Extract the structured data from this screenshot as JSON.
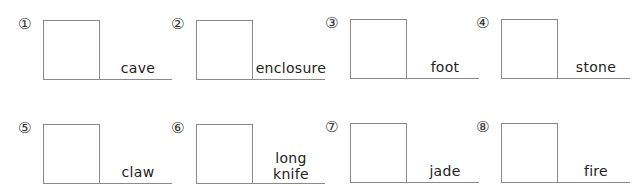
{
  "worksheet": {
    "items": [
      {
        "number": "①",
        "word": "cave"
      },
      {
        "number": "②",
        "word": "enclosure"
      },
      {
        "number": "③",
        "word": "foot"
      },
      {
        "number": "④",
        "word": "stone"
      },
      {
        "number": "⑤",
        "word": "claw"
      },
      {
        "number": "⑥",
        "word": "long\nknife"
      },
      {
        "number": "⑦",
        "word": "jade"
      },
      {
        "number": "⑧",
        "word": "fire"
      }
    ]
  }
}
